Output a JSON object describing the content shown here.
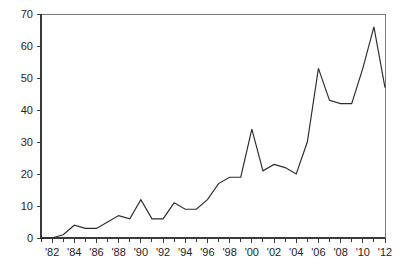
{
  "chart_data": {
    "type": "line",
    "title": "",
    "subtitle": "",
    "xlabel": "",
    "ylabel": "",
    "xlim": [
      1981,
      2012
    ],
    "ylim": [
      0,
      70
    ],
    "grid": false,
    "legend": "none",
    "x": [
      1981,
      1982,
      1983,
      1984,
      1985,
      1986,
      1987,
      1988,
      1989,
      1990,
      1991,
      1992,
      1993,
      1994,
      1995,
      1996,
      1997,
      1998,
      1999,
      2000,
      2001,
      2002,
      2003,
      2004,
      2005,
      2006,
      2007,
      2008,
      2009,
      2010,
      2011,
      2012
    ],
    "values": [
      0,
      0,
      1,
      4,
      3,
      3,
      5,
      7,
      6,
      12,
      6,
      6,
      11,
      9,
      9,
      12,
      17,
      19,
      19,
      34,
      21,
      23,
      22,
      20,
      30,
      53,
      43,
      42,
      42,
      53,
      66,
      47
    ],
    "series": [
      {
        "name": "count",
        "color": "#2b2b2b",
        "values": [
          0,
          0,
          1,
          4,
          3,
          3,
          5,
          7,
          6,
          12,
          6,
          6,
          11,
          9,
          9,
          12,
          17,
          19,
          19,
          34,
          21,
          23,
          22,
          20,
          30,
          53,
          43,
          42,
          42,
          53,
          66,
          47
        ]
      }
    ],
    "y_ticks": [
      0,
      10,
      20,
      30,
      40,
      50,
      60,
      70
    ],
    "y_tick_labels": [
      "0",
      "10",
      "20",
      "30",
      "40",
      "50",
      "60",
      "70"
    ],
    "x_ticks": [
      1982,
      1984,
      1986,
      1988,
      1990,
      1992,
      1994,
      1996,
      1998,
      2000,
      2002,
      2004,
      2006,
      2008,
      2010,
      2012
    ],
    "x_tick_labels": [
      "'82",
      "'84",
      "'86",
      "'88",
      "'90",
      "'92",
      "'94",
      "'96",
      "'98",
      "'00",
      "'02",
      "'04",
      "'06",
      "'08",
      "'10",
      "'12"
    ],
    "x_minor_ticks": [
      1981,
      1983,
      1985,
      1987,
      1989,
      1991,
      1993,
      1995,
      1997,
      1999,
      2001,
      2003,
      2005,
      2007,
      2009,
      2011
    ],
    "axis_color": "#3a3a3a",
    "frame_color": "#7a7a7a",
    "background_color": "#ffffff"
  },
  "plot_geometry": {
    "left": 41,
    "right": 385,
    "top": 14,
    "bottom": 238
  }
}
